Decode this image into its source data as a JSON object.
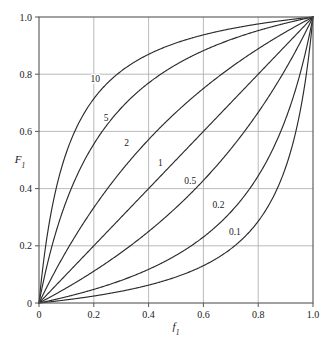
{
  "chart_data": {
    "type": "line",
    "title": "",
    "xlabel": "f1",
    "ylabel": "F1",
    "xlabel_base": "f",
    "xlabel_sub": "1",
    "ylabel_base": "F",
    "ylabel_sub": "1",
    "xlim": [
      0,
      1
    ],
    "ylim": [
      0,
      1
    ],
    "grid": true,
    "legend": "inline-curve-labels",
    "xticks": [
      0,
      0.2,
      0.4,
      0.6,
      0.8,
      1.0
    ],
    "xticklabels": [
      "0",
      "0.2",
      "0.4",
      "0.6",
      "0.8",
      "1.0"
    ],
    "yticks": [
      0,
      0.2,
      0.4,
      0.6,
      0.8,
      1.0
    ],
    "yticklabels": [
      "0",
      "0.2",
      "0.4",
      "0.6",
      "0.8",
      "1.0"
    ],
    "equation": "F1 = a*f1 / (1 + (a-1)*f1)",
    "curve_color": "#2b2b2b",
    "grid_color": "#a8a8a8",
    "frame_color": "#555555",
    "series": [
      {
        "name": "10",
        "alpha": 10,
        "label": "10",
        "label_x": 0.205,
        "label_y": 0.785,
        "x": [
          0,
          0.02,
          0.05,
          0.1,
          0.15,
          0.2,
          0.25,
          0.3,
          0.35,
          0.4,
          0.45,
          0.5,
          0.55,
          0.6,
          0.65,
          0.7,
          0.75,
          0.8,
          0.85,
          0.9,
          0.95,
          1.0
        ],
        "values": [
          0,
          0.169,
          0.345,
          0.526,
          0.638,
          0.714,
          0.769,
          0.811,
          0.843,
          0.87,
          0.891,
          0.909,
          0.924,
          0.938,
          0.949,
          0.959,
          0.968,
          0.976,
          0.983,
          0.989,
          0.995,
          1.0
        ]
      },
      {
        "name": "5",
        "alpha": 5,
        "label": "5",
        "label_x": 0.245,
        "label_y": 0.648,
        "x": [
          0,
          0.02,
          0.05,
          0.1,
          0.15,
          0.2,
          0.25,
          0.3,
          0.35,
          0.4,
          0.45,
          0.5,
          0.55,
          0.6,
          0.65,
          0.7,
          0.75,
          0.8,
          0.85,
          0.9,
          0.95,
          1.0
        ],
        "values": [
          0,
          0.093,
          0.208,
          0.357,
          0.469,
          0.556,
          0.625,
          0.682,
          0.729,
          0.769,
          0.804,
          0.833,
          0.859,
          0.882,
          0.903,
          0.921,
          0.938,
          0.952,
          0.966,
          0.978,
          0.99,
          1.0
        ]
      },
      {
        "name": "2",
        "alpha": 2,
        "label": "2",
        "label_x": 0.32,
        "label_y": 0.56,
        "x": [
          0,
          0.05,
          0.1,
          0.15,
          0.2,
          0.25,
          0.3,
          0.35,
          0.4,
          0.45,
          0.5,
          0.55,
          0.6,
          0.65,
          0.7,
          0.75,
          0.8,
          0.85,
          0.9,
          0.95,
          1.0
        ],
        "values": [
          0,
          0.095,
          0.182,
          0.261,
          0.333,
          0.4,
          0.462,
          0.519,
          0.571,
          0.621,
          0.667,
          0.71,
          0.75,
          0.788,
          0.824,
          0.857,
          0.889,
          0.919,
          0.947,
          0.974,
          1.0
        ]
      },
      {
        "name": "1",
        "alpha": 1,
        "label": "1",
        "label_x": 0.443,
        "label_y": 0.492,
        "x": [
          0,
          0.1,
          0.2,
          0.3,
          0.4,
          0.5,
          0.6,
          0.7,
          0.8,
          0.9,
          1.0
        ],
        "values": [
          0,
          0.1,
          0.2,
          0.3,
          0.4,
          0.5,
          0.6,
          0.7,
          0.8,
          0.9,
          1.0
        ]
      },
      {
        "name": "0.5",
        "alpha": 0.5,
        "label": "0.5",
        "label_x": 0.552,
        "label_y": 0.428,
        "x": [
          0,
          0.05,
          0.1,
          0.15,
          0.2,
          0.25,
          0.3,
          0.35,
          0.4,
          0.45,
          0.5,
          0.55,
          0.6,
          0.65,
          0.7,
          0.75,
          0.8,
          0.85,
          0.9,
          0.95,
          1.0
        ],
        "values": [
          0,
          0.026,
          0.053,
          0.081,
          0.111,
          0.143,
          0.176,
          0.212,
          0.25,
          0.29,
          0.333,
          0.379,
          0.429,
          0.481,
          0.538,
          0.6,
          0.667,
          0.739,
          0.818,
          0.905,
          1.0
        ]
      },
      {
        "name": "0.2",
        "alpha": 0.2,
        "label": "0.2",
        "label_x": 0.655,
        "label_y": 0.345,
        "x": [
          0,
          0.05,
          0.1,
          0.15,
          0.2,
          0.25,
          0.3,
          0.35,
          0.4,
          0.45,
          0.5,
          0.55,
          0.6,
          0.65,
          0.7,
          0.75,
          0.8,
          0.85,
          0.9,
          0.95,
          0.98,
          1.0
        ],
        "values": [
          0,
          0.01,
          0.022,
          0.034,
          0.048,
          0.063,
          0.079,
          0.097,
          0.118,
          0.141,
          0.167,
          0.196,
          0.231,
          0.271,
          0.318,
          0.375,
          0.444,
          0.531,
          0.643,
          0.792,
          0.907,
          1.0
        ]
      },
      {
        "name": "0.1",
        "alpha": 0.1,
        "label": "0.1",
        "label_x": 0.715,
        "label_y": 0.248,
        "x": [
          0,
          0.05,
          0.1,
          0.15,
          0.2,
          0.25,
          0.3,
          0.35,
          0.4,
          0.45,
          0.5,
          0.55,
          0.6,
          0.65,
          0.7,
          0.75,
          0.8,
          0.85,
          0.9,
          0.95,
          0.98,
          1.0
        ],
        "values": [
          0,
          0.005,
          0.011,
          0.017,
          0.024,
          0.032,
          0.041,
          0.051,
          0.063,
          0.076,
          0.091,
          0.109,
          0.13,
          0.157,
          0.189,
          0.231,
          0.286,
          0.362,
          0.474,
          0.655,
          0.82,
          1.0
        ]
      }
    ]
  }
}
